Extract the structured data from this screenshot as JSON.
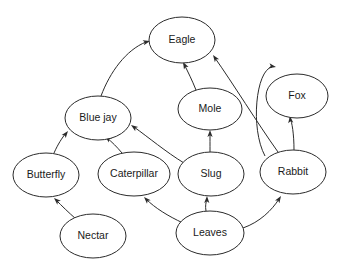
{
  "diagram": {
    "type": "food-web-directed-graph",
    "background_color": "#ffffff",
    "node_fill": "#ffffff",
    "node_stroke": "#2b2b2b",
    "edge_color": "#2b2b2b",
    "nodes": [
      {
        "id": "eagle",
        "label": "Eagle",
        "cx": 182,
        "cy": 40,
        "rx": 33,
        "ry": 23
      },
      {
        "id": "fox",
        "label": "Fox",
        "cx": 297,
        "cy": 96,
        "rx": 31,
        "ry": 22
      },
      {
        "id": "mole",
        "label": "Mole",
        "cx": 210,
        "cy": 109,
        "rx": 32,
        "ry": 21
      },
      {
        "id": "bluejay",
        "label": "Blue jay",
        "cx": 98,
        "cy": 118,
        "rx": 33,
        "ry": 22
      },
      {
        "id": "butterfly",
        "label": "Butterfly",
        "cx": 46,
        "cy": 175,
        "rx": 33,
        "ry": 22
      },
      {
        "id": "caterpillar",
        "label": "Caterpillar",
        "cx": 134,
        "cy": 174,
        "rx": 36,
        "ry": 22
      },
      {
        "id": "slug",
        "label": "Slug",
        "cx": 211,
        "cy": 174,
        "rx": 33,
        "ry": 22
      },
      {
        "id": "rabbit",
        "label": "Rabbit",
        "cx": 293,
        "cy": 172,
        "rx": 33,
        "ry": 22
      },
      {
        "id": "nectar",
        "label": "Nectar",
        "cx": 93,
        "cy": 236,
        "rx": 33,
        "ry": 22
      },
      {
        "id": "leaves",
        "label": "Leaves",
        "cx": 210,
        "cy": 233,
        "rx": 34,
        "ry": 22
      }
    ],
    "edges": [
      {
        "id": "bluejay-eagle",
        "from": "bluejay",
        "to": "eagle",
        "path": "M 101 96 C 110 72 126 50 146 42",
        "arrow_x": 150,
        "arrow_y": 41,
        "arrow_angle": -15
      },
      {
        "id": "mole-eagle",
        "from": "mole",
        "to": "eagle",
        "path": "M 196 90 C 192 80 188 72 184 64",
        "arrow_x": 183,
        "arrow_y": 62,
        "arrow_angle": -118
      },
      {
        "id": "rabbit-eagle",
        "from": "rabbit",
        "to": "eagle",
        "path": "M 278 152 C 258 124 232 82 215 58",
        "arrow_x": 213,
        "arrow_y": 55,
        "arrow_angle": -125
      },
      {
        "id": "rabbit-fox",
        "from": "rabbit",
        "to": "fox",
        "path": "M 294 150 C 294 134 292 122 290 118",
        "arrow_x": 290,
        "arrow_y": 116,
        "arrow_angle": -96
      },
      {
        "id": "rabbit-fox-curve",
        "from": "rabbit",
        "to": "fox",
        "path": "M 265 156 C 250 128 256 70 272 67",
        "arrow_x": 276,
        "arrow_y": 67,
        "arrow_angle": 10
      },
      {
        "id": "slug-mole",
        "from": "slug",
        "to": "mole",
        "path": "M 210 152 C 210 144 210 138 210 133",
        "arrow_x": 210,
        "arrow_y": 130,
        "arrow_angle": -90
      },
      {
        "id": "slug-bluejay",
        "from": "slug",
        "to": "bluejay",
        "path": "M 184 163 C 166 152 148 137 134 127",
        "arrow_x": 131,
        "arrow_y": 125,
        "arrow_angle": 215
      },
      {
        "id": "caterpillar-bluejay",
        "from": "caterpillar",
        "to": "bluejay",
        "path": "M 122 153 C 117 147 112 142 107 138",
        "arrow_x": 105,
        "arrow_y": 136,
        "arrow_angle": 219
      },
      {
        "id": "butterfly-bluejay",
        "from": "butterfly",
        "to": "bluejay",
        "path": "M 54 153 C 58 144 62 138 66 133",
        "arrow_x": 68,
        "arrow_y": 131,
        "arrow_angle": -52
      },
      {
        "id": "nectar-butterfly",
        "from": "nectar",
        "to": "butterfly",
        "path": "M 76 219 C 68 212 62 206 56 200",
        "arrow_x": 54,
        "arrow_y": 198,
        "arrow_angle": -137
      },
      {
        "id": "leaves-caterpillar",
        "from": "leaves",
        "to": "caterpillar",
        "path": "M 183 223 C 168 216 155 208 146 199",
        "arrow_x": 144,
        "arrow_y": 197,
        "arrow_angle": -134
      },
      {
        "id": "leaves-slug",
        "from": "leaves",
        "to": "slug",
        "path": "M 206 211 C 205 206 206 202 207 199",
        "arrow_x": 207,
        "arrow_y": 196,
        "arrow_angle": -88
      },
      {
        "id": "leaves-rabbit",
        "from": "leaves",
        "to": "rabbit",
        "path": "M 243 228 C 260 222 272 210 279 199",
        "arrow_x": 281,
        "arrow_y": 196,
        "arrow_angle": -57
      }
    ]
  }
}
